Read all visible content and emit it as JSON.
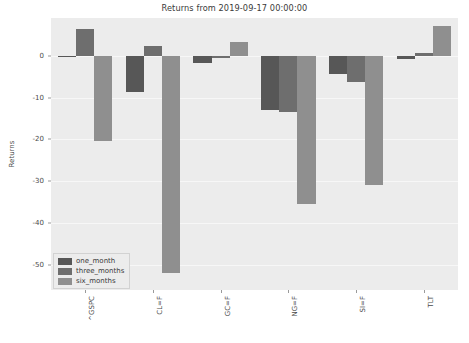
{
  "chart_data": {
    "type": "bar",
    "title": "Returns from 2019-09-17 00:00:00",
    "xlabel": "",
    "ylabel": "Returns",
    "categories": [
      "^GSPC",
      "CL=F",
      "GC=F",
      "NG=F",
      "SI=F",
      "TLT"
    ],
    "series": [
      {
        "name": "one_month",
        "color": "#575757",
        "values": [
          -0.2,
          -8.8,
          -1.8,
          -13.0,
          -4.5,
          -0.8
        ]
      },
      {
        "name": "three_months",
        "color": "#6e6e6e",
        "values": [
          6.3,
          2.2,
          -0.5,
          -13.5,
          -6.2,
          0.7
        ]
      },
      {
        "name": "six_months",
        "color": "#8f8f8f",
        "values": [
          -20.5,
          -52.0,
          3.3,
          -35.5,
          -31.0,
          7.0
        ]
      }
    ],
    "ylim": [
      -56,
      9
    ],
    "yticks": [
      0,
      -10,
      -20,
      -30,
      -40,
      -50
    ],
    "ytick_labels": [
      "0",
      "-10",
      "-20",
      "-30",
      "-40",
      "-50"
    ],
    "grid": true,
    "legend_position": "lower left",
    "plot_background": "#ececec",
    "figure_background": "#ffffff"
  }
}
